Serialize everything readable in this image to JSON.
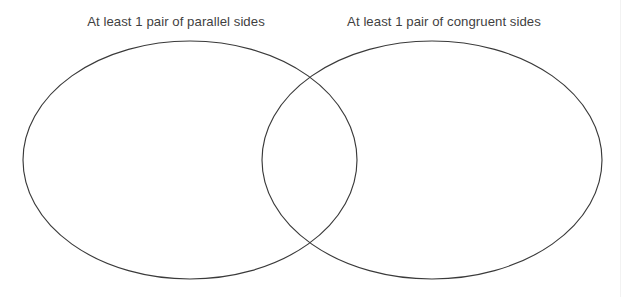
{
  "diagram": {
    "type": "venn",
    "title": "",
    "background_color": "#ffffff",
    "stroke_color": "#3a3a3a",
    "text_color": "#3f3f3f",
    "sets": [
      {
        "id": "parallel-sides",
        "label": "At least 1 pair of parallel sides",
        "position": "left",
        "center_x": 190,
        "center_y": 160,
        "radius_x": 167,
        "radius_y": 119
      },
      {
        "id": "congruent-sides",
        "label": "At least 1 pair of congruent sides",
        "position": "right",
        "center_x": 432,
        "center_y": 160,
        "radius_x": 170,
        "radius_y": 119
      }
    ],
    "regions": {
      "left_only_items": [],
      "intersection_items": [],
      "right_only_items": []
    }
  }
}
